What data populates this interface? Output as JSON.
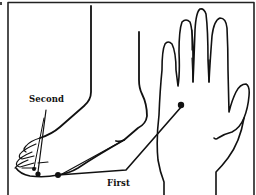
{
  "figure": {
    "labels": {
      "second": "Second",
      "first": "First"
    },
    "points": [
      {
        "name": "first-point-foot",
        "label": "First",
        "location": "inner side of foot, ball of big toe"
      },
      {
        "name": "first-point-hand",
        "label": "First",
        "location": "center of palm"
      },
      {
        "name": "second-point-foot",
        "label": "Second",
        "location": "tip of toes"
      }
    ],
    "colors": {
      "line": "#111111",
      "background": "#ffffff",
      "frame": "#222222"
    }
  }
}
